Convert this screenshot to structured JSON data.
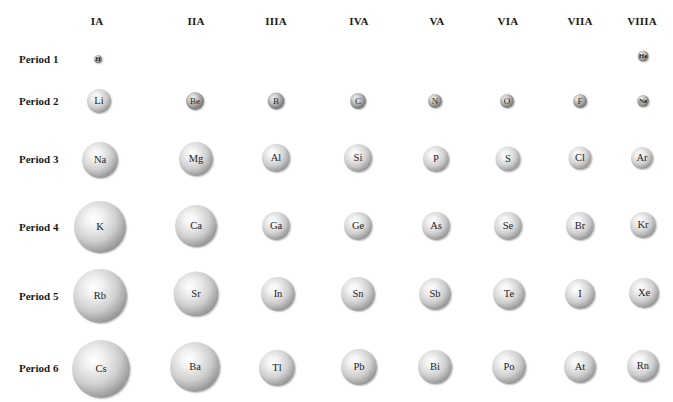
{
  "groups": [
    {
      "label": "IA",
      "x": 97
    },
    {
      "label": "IIA",
      "x": 196
    },
    {
      "label": "IIIA",
      "x": 276
    },
    {
      "label": "IVA",
      "x": 359
    },
    {
      "label": "VA",
      "x": 437
    },
    {
      "label": "VIA",
      "x": 508
    },
    {
      "label": "VIIA",
      "x": 580
    },
    {
      "label": "VIIIA",
      "x": 642
    }
  ],
  "periods": [
    {
      "label": "Period 1",
      "y": 59
    },
    {
      "label": "Period 2",
      "y": 101
    },
    {
      "label": "Period 3",
      "y": 159
    },
    {
      "label": "Period 4",
      "y": 227
    },
    {
      "label": "Period 5",
      "y": 296
    },
    {
      "label": "Period 6",
      "y": 368
    }
  ],
  "atoms": [
    {
      "symbol": "H",
      "x": 98,
      "y": 59,
      "d": 8,
      "size": "tiny"
    },
    {
      "symbol": "He",
      "x": 643,
      "y": 56,
      "d": 11,
      "size": "tiny"
    },
    {
      "symbol": "Li",
      "x": 99,
      "y": 101,
      "d": 24,
      "size": "normal"
    },
    {
      "symbol": "Be",
      "x": 195,
      "y": 101,
      "d": 18,
      "size": "small"
    },
    {
      "symbol": "B",
      "x": 276,
      "y": 101,
      "d": 17,
      "size": "small"
    },
    {
      "symbol": "C",
      "x": 358,
      "y": 101,
      "d": 16,
      "size": "small"
    },
    {
      "symbol": "N",
      "x": 435,
      "y": 101,
      "d": 14,
      "size": "small"
    },
    {
      "symbol": "O",
      "x": 507,
      "y": 101,
      "d": 14,
      "size": "small"
    },
    {
      "symbol": "F",
      "x": 580,
      "y": 101,
      "d": 14,
      "size": "small"
    },
    {
      "symbol": "Ne",
      "x": 643,
      "y": 101,
      "d": 12,
      "size": "tiny"
    },
    {
      "symbol": "Na",
      "x": 100,
      "y": 160,
      "d": 36,
      "size": "normal"
    },
    {
      "symbol": "Mg",
      "x": 196,
      "y": 159,
      "d": 34,
      "size": "normal"
    },
    {
      "symbol": "Al",
      "x": 276,
      "y": 158,
      "d": 28,
      "size": "normal"
    },
    {
      "symbol": "Si",
      "x": 358,
      "y": 158,
      "d": 28,
      "size": "normal"
    },
    {
      "symbol": "P",
      "x": 436,
      "y": 159,
      "d": 26,
      "size": "normal"
    },
    {
      "symbol": "S",
      "x": 508,
      "y": 159,
      "d": 25,
      "size": "normal"
    },
    {
      "symbol": "Cl",
      "x": 580,
      "y": 158,
      "d": 23,
      "size": "normal"
    },
    {
      "symbol": "Ar",
      "x": 642,
      "y": 158,
      "d": 22,
      "size": "normal"
    },
    {
      "symbol": "K",
      "x": 100,
      "y": 227,
      "d": 52,
      "size": "normal"
    },
    {
      "symbol": "Ca",
      "x": 196,
      "y": 226,
      "d": 42,
      "size": "normal"
    },
    {
      "symbol": "Ga",
      "x": 276,
      "y": 226,
      "d": 28,
      "size": "normal"
    },
    {
      "symbol": "Ge",
      "x": 358,
      "y": 226,
      "d": 28,
      "size": "normal"
    },
    {
      "symbol": "As",
      "x": 436,
      "y": 226,
      "d": 28,
      "size": "normal"
    },
    {
      "symbol": "Se",
      "x": 508,
      "y": 226,
      "d": 28,
      "size": "normal"
    },
    {
      "symbol": "Br",
      "x": 580,
      "y": 226,
      "d": 28,
      "size": "normal"
    },
    {
      "symbol": "Kr",
      "x": 643,
      "y": 225,
      "d": 26,
      "size": "normal"
    },
    {
      "symbol": "Rb",
      "x": 100,
      "y": 296,
      "d": 54,
      "size": "normal"
    },
    {
      "symbol": "Sr",
      "x": 196,
      "y": 294,
      "d": 45,
      "size": "normal"
    },
    {
      "symbol": "In",
      "x": 278,
      "y": 294,
      "d": 34,
      "size": "normal"
    },
    {
      "symbol": "Sn",
      "x": 358,
      "y": 294,
      "d": 34,
      "size": "normal"
    },
    {
      "symbol": "Sb",
      "x": 435,
      "y": 294,
      "d": 32,
      "size": "normal"
    },
    {
      "symbol": "Te",
      "x": 509,
      "y": 294,
      "d": 32,
      "size": "normal"
    },
    {
      "symbol": "I",
      "x": 580,
      "y": 294,
      "d": 30,
      "size": "normal"
    },
    {
      "symbol": "Xe",
      "x": 644,
      "y": 293,
      "d": 30,
      "size": "normal"
    },
    {
      "symbol": "Cs",
      "x": 101,
      "y": 369,
      "d": 58,
      "size": "normal"
    },
    {
      "symbol": "Ba",
      "x": 195,
      "y": 367,
      "d": 50,
      "size": "normal"
    },
    {
      "symbol": "Tl",
      "x": 277,
      "y": 368,
      "d": 36,
      "size": "normal"
    },
    {
      "symbol": "Pb",
      "x": 359,
      "y": 367,
      "d": 36,
      "size": "normal"
    },
    {
      "symbol": "Bi",
      "x": 435,
      "y": 367,
      "d": 34,
      "size": "normal"
    },
    {
      "symbol": "Po",
      "x": 509,
      "y": 367,
      "d": 34,
      "size": "normal"
    },
    {
      "symbol": "At",
      "x": 580,
      "y": 367,
      "d": 32,
      "size": "normal"
    },
    {
      "symbol": "Rn",
      "x": 643,
      "y": 366,
      "d": 32,
      "size": "normal"
    }
  ]
}
